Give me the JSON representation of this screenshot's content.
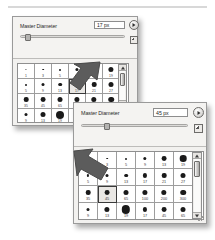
{
  "app": {
    "name": "brush-preset-picker",
    "accent_hex": "#3a3a3a",
    "panel_bg_hex": "#f2f1ef",
    "grid_bg_hex": "#ffffff"
  },
  "panel_back": {
    "label": "Master Diameter",
    "value": "17 px",
    "value_placeholder": "px",
    "slider_percent": 6,
    "menu_button_icon": "triangle-right-icon",
    "preset_menu_icon": "panel-menu-icon",
    "selected_size": 17,
    "columns": 6,
    "rows": [
      [
        {
          "size": 1,
          "dot": 1.2
        },
        {
          "size": 3,
          "dot": 1.6
        },
        {
          "size": 5,
          "dot": 2.0
        },
        {
          "size": 9,
          "dot": 3.2
        },
        {
          "size": 13,
          "dot": 4.0
        },
        {
          "size": 19,
          "dot": 5.2
        }
      ],
      [
        {
          "size": 5,
          "dot": 2.0
        },
        {
          "size": 9,
          "dot": 3.0
        },
        {
          "size": 13,
          "dot": 3.6
        },
        {
          "size": 17,
          "dot": 4.2
        },
        {
          "size": 21,
          "dot": 4.6
        },
        {
          "size": 27,
          "dot": 5.0
        }
      ],
      [
        {
          "size": 35,
          "dot": 4.6
        },
        {
          "size": 45,
          "dot": 4.8
        },
        {
          "size": 65,
          "dot": 5.0
        },
        {
          "size": 100,
          "dot": 5.2
        },
        {
          "size": 200,
          "dot": 5.4
        },
        {
          "size": 300,
          "dot": 5.6
        }
      ],
      [
        {
          "size": 9,
          "dot": 3.0
        },
        {
          "size": 13,
          "dot": 5.0
        },
        {
          "size": 19,
          "dot": 8.0
        },
        {
          "size": 17,
          "dot": 4.2
        },
        {
          "size": 45,
          "dot": 4.8
        },
        {
          "size": 65,
          "dot": 5.0
        }
      ]
    ],
    "scrollbar": {
      "up_arrow": "scroll-up-arrow-icon",
      "down_arrow": "scroll-down-arrow-icon",
      "thumb_top_percent": 2,
      "thumb_height_percent": 30
    }
  },
  "panel_front": {
    "label": "Master Diameter",
    "value": "45 px",
    "value_placeholder": "px",
    "slider_percent": 23,
    "menu_button_icon": "triangle-right-icon",
    "preset_menu_icon": "panel-menu-icon",
    "selected_size": 45,
    "columns": 6,
    "rows": [
      [
        {
          "size": 1,
          "dot": 1.2
        },
        {
          "size": 3,
          "dot": 1.6
        },
        {
          "size": 5,
          "dot": 2.0
        },
        {
          "size": 9,
          "dot": 3.4
        },
        {
          "size": 13,
          "dot": 4.8
        },
        {
          "size": 19,
          "dot": 6.6
        }
      ],
      [
        {
          "size": 5,
          "dot": 2.2
        },
        {
          "size": 9,
          "dot": 3.0
        },
        {
          "size": 13,
          "dot": 3.6
        },
        {
          "size": 17,
          "dot": 4.2
        },
        {
          "size": 21,
          "dot": 4.6
        },
        {
          "size": 27,
          "dot": 5.0
        }
      ],
      [
        {
          "size": 35,
          "dot": 4.6
        },
        {
          "size": 45,
          "dot": 4.8
        },
        {
          "size": 65,
          "dot": 5.0
        },
        {
          "size": 100,
          "dot": 5.2
        },
        {
          "size": 200,
          "dot": 5.4
        },
        {
          "size": 300,
          "dot": 5.6
        }
      ],
      [
        {
          "size": 9,
          "dot": 3.0
        },
        {
          "size": 13,
          "dot": 5.2
        },
        {
          "size": 19,
          "dot": 8.4
        },
        {
          "size": 17,
          "dot": 4.2
        },
        {
          "size": 45,
          "dot": 4.8
        },
        {
          "size": 65,
          "dot": 5.0
        }
      ]
    ],
    "scrollbar": {
      "up_arrow": "scroll-up-arrow-icon",
      "down_arrow": "scroll-down-arrow-icon",
      "thumb_top_percent": 4,
      "thumb_height_percent": 26
    }
  },
  "annotations": [
    {
      "name": "pointer-arrow-back",
      "points_to": "17 px cell",
      "color": "#5a5a5a"
    },
    {
      "name": "pointer-arrow-front",
      "points_to": "45 px cell",
      "color": "#5a5a5a"
    }
  ]
}
